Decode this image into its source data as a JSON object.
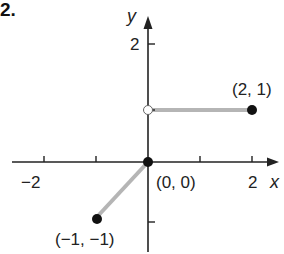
{
  "problem": {
    "number": "2."
  },
  "axes": {
    "x_label": "x",
    "y_label": "y",
    "x_ticks": [
      {
        "value": -2,
        "label": "−2"
      },
      {
        "value": -1,
        "label": ""
      },
      {
        "value": 1,
        "label": ""
      },
      {
        "value": 2,
        "label": "2"
      }
    ],
    "y_ticks": [
      {
        "value": 2,
        "label": "2"
      },
      {
        "value": 1,
        "label": ""
      },
      {
        "value": -1,
        "label": ""
      }
    ]
  },
  "points": [
    {
      "label": "(2, 1)",
      "x": 2,
      "y": 1,
      "filled": true
    },
    {
      "label": "(0, 0)",
      "x": 0,
      "y": 0,
      "filled": true
    },
    {
      "label": "(−1, −1)",
      "x": -1,
      "y": -1,
      "filled": true
    },
    {
      "label": "",
      "x": 0,
      "y": 1,
      "filled": false
    }
  ],
  "segments": [
    {
      "from": [
        -1,
        -1
      ],
      "to": [
        0,
        0
      ]
    },
    {
      "from": [
        0,
        1
      ],
      "to": [
        2,
        1
      ]
    }
  ],
  "colors": {
    "axis": "#222222",
    "segment": "#b5b5b5",
    "point": "#111111"
  }
}
